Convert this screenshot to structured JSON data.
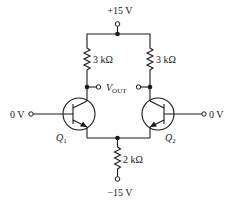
{
  "diagram": {
    "type": "circuit-schematic",
    "supply_positive": {
      "label": "+15 V"
    },
    "supply_negative": {
      "label": "−15 V"
    },
    "resistors": [
      {
        "id": "RC1",
        "label": "3 kΩ"
      },
      {
        "id": "RC2",
        "label": "3 kΩ"
      },
      {
        "id": "RE",
        "label": "2 kΩ"
      }
    ],
    "transistors": [
      {
        "id": "Q1",
        "name": "Q",
        "sub": "1",
        "type": "npn"
      },
      {
        "id": "Q2",
        "name": "Q",
        "sub": "2",
        "type": "npn"
      }
    ],
    "inputs": [
      {
        "id": "in1",
        "label": "0 V"
      },
      {
        "id": "in2",
        "label": "0 V"
      }
    ],
    "output": {
      "name": "V",
      "sub": "OUT"
    }
  }
}
